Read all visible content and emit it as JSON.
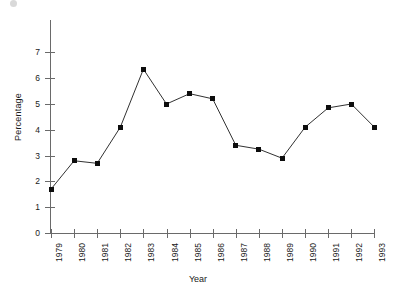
{
  "chart_data": {
    "type": "line",
    "title": "",
    "xlabel": "Year",
    "ylabel": "Percentage",
    "categories": [
      "1979",
      "1980",
      "1981",
      "1982",
      "1983",
      "1984",
      "1985",
      "1986",
      "1987",
      "1988",
      "1989",
      "1990",
      "1991",
      "1992",
      "1993"
    ],
    "values": [
      1.7,
      2.8,
      2.7,
      4.1,
      6.35,
      5.0,
      5.4,
      5.2,
      3.4,
      3.25,
      2.9,
      4.1,
      4.85,
      5.0,
      4.1
    ],
    "series": [
      {
        "name": "Percentage",
        "values": [
          1.7,
          2.8,
          2.7,
          4.1,
          6.35,
          5.0,
          5.4,
          5.2,
          3.4,
          3.25,
          2.9,
          4.1,
          4.85,
          5.0,
          4.1
        ]
      }
    ],
    "ylim": [
      0,
      7
    ],
    "yticks": [
      0,
      1,
      2,
      3,
      4,
      5,
      6,
      7
    ],
    "ytick_labels": [
      "0",
      "1",
      "2",
      "3",
      "4",
      "5",
      "6",
      "7"
    ],
    "grid": false,
    "legend": "none",
    "marker": "filled-square",
    "line_color": "#1a1a1a",
    "marker_color": "#0d0d0d",
    "axis_color": "#6a6a6a"
  },
  "axes": {
    "ylabel_text": "Percentage",
    "xlabel_text": "Year"
  }
}
